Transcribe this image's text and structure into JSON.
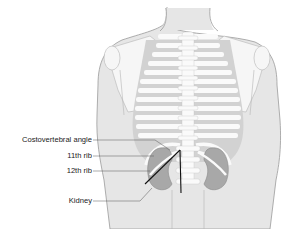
{
  "figure": {
    "labels": [
      {
        "id": "cva",
        "text": "Costovertebral angle"
      },
      {
        "id": "rib11",
        "text": "11th rib"
      },
      {
        "id": "rib12",
        "text": "12th rib"
      },
      {
        "id": "kidney",
        "text": "Kidney"
      }
    ],
    "colors": {
      "skin": "#e6e6e6",
      "skin_outline": "#9a9a9a",
      "bone": "#fafafa",
      "rib_gap": "#d2d2d2",
      "kidney": "#a8a8a8",
      "leader": "#555555",
      "angle_line": "#111111"
    }
  }
}
